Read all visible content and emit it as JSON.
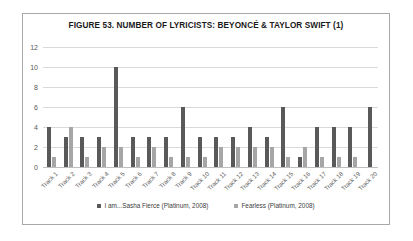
{
  "figure": {
    "title": "FIGURE 53. NUMBER OF LYRICISTS: BEYONCÉ & TAYLOR SWIFT (1)"
  },
  "legend": {
    "items": [
      {
        "label": "I am...Sasha Fierce (Platinum, 2008)",
        "color": "#595959"
      },
      {
        "label": "Fearless (Platinum, 2008)",
        "color": "#a6a6a6"
      }
    ]
  },
  "axis": {
    "y_ticks": [
      "0",
      "2",
      "4",
      "6",
      "8",
      "10",
      "12"
    ]
  },
  "chart_data": {
    "type": "bar",
    "title": "FIGURE 53. NUMBER OF LYRICISTS: BEYONCÉ & TAYLOR SWIFT (1)",
    "xlabel": "",
    "ylabel": "",
    "ylim": [
      0,
      12
    ],
    "ytick_step": 2,
    "grid": true,
    "legend_position": "bottom",
    "categories": [
      "Track 1",
      "Track 2",
      "Track 3",
      "Track 4",
      "Track 5",
      "Track 6",
      "Track 7",
      "Track 8",
      "Track 9",
      "Track 10",
      "Track 11",
      "Track 12",
      "Track 13",
      "Track 14",
      "Track 15",
      "Track 16",
      "Track 17",
      "Track 18",
      "Track 19",
      "Track 20"
    ],
    "series": [
      {
        "name": "I am...Sasha Fierce (Platinum, 2008)",
        "color": "#595959",
        "values": [
          4,
          3,
          3,
          3,
          10,
          3,
          3,
          3,
          6,
          3,
          3,
          3,
          4,
          3,
          6,
          1,
          4,
          4,
          4,
          6
        ]
      },
      {
        "name": "Fearless (Platinum, 2008)",
        "color": "#a6a6a6",
        "values": [
          1,
          4,
          1,
          2,
          2,
          1,
          2,
          1,
          1,
          1,
          2,
          2,
          2,
          2,
          1,
          2,
          1,
          1,
          1,
          0
        ]
      }
    ]
  }
}
